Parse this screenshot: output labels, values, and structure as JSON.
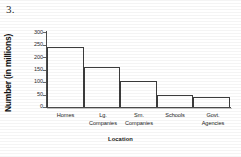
{
  "question": {
    "number": "3."
  },
  "chart_data": {
    "type": "bar",
    "title": "",
    "xlabel": "Location",
    "ylabel": "Number (in millions)",
    "categories": [
      "Homes",
      "Lg. Companies",
      "Sm. Companies",
      "Schools",
      "Govt. Agencies"
    ],
    "category_lines": [
      [
        "Homes",
        ""
      ],
      [
        "Lg.",
        "Companies"
      ],
      [
        "Sm.",
        "Companies"
      ],
      [
        "Schools",
        ""
      ],
      [
        "Govt.",
        "Agencies"
      ]
    ],
    "values": [
      240,
      160,
      105,
      50,
      40
    ],
    "ylim": [
      0,
      300
    ],
    "yticks": [
      0,
      50,
      100,
      150,
      200,
      250,
      300
    ],
    "ytick_labels": [
      "0",
      "50",
      "100",
      "150",
      "200",
      "250",
      "300"
    ],
    "grid": false,
    "legend": "none",
    "bar_fill": "#ffffff",
    "bar_stroke": "#3c3c3c",
    "axis_color": "#4a4a4a"
  }
}
